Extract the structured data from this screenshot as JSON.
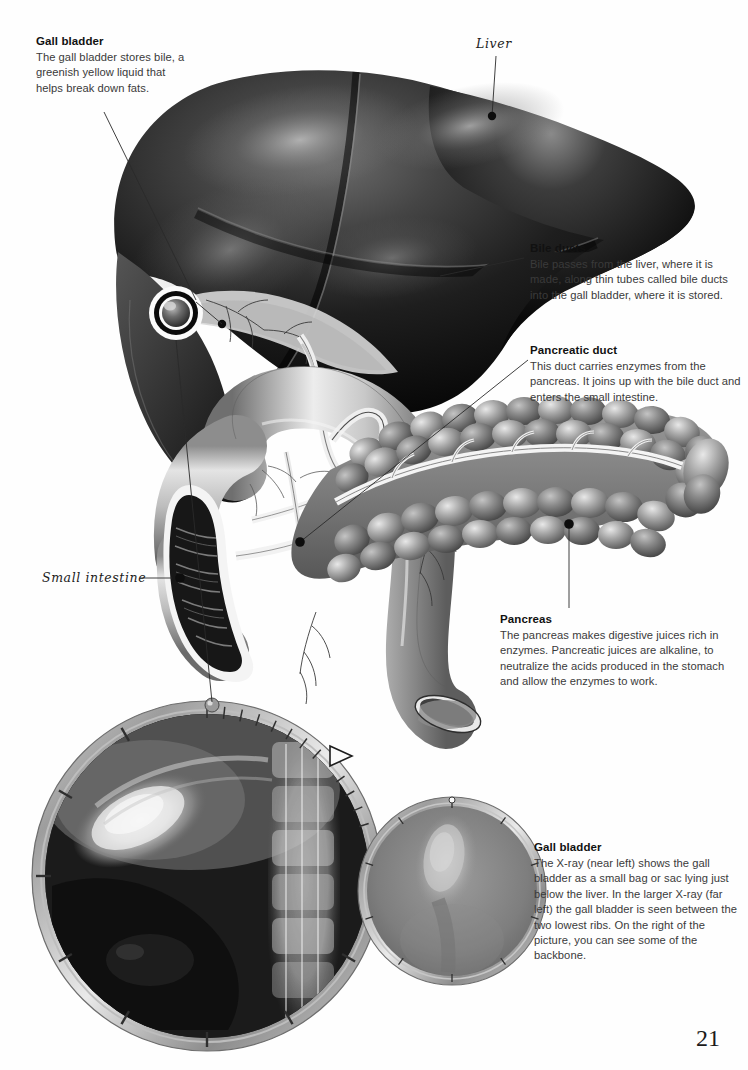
{
  "page": {
    "number": "21",
    "background_color": "#fefefe"
  },
  "captions": [
    {
      "id": "gall-bladder",
      "heading": "Gall bladder",
      "body": "The gall bladder stores bile, a greenish yellow liquid that helps break down fats."
    },
    {
      "id": "bile-ducts",
      "heading": "Bile ducts",
      "body": "Bile passes from the liver, where it is made, along thin tubes called bile ducts into the gall bladder, where it is stored."
    },
    {
      "id": "pancreatic-duct",
      "heading": "Pancreatic duct",
      "body": "This duct carries enzymes from the pancreas. It joins up with the bile duct and enters the small intestine."
    },
    {
      "id": "pancreas",
      "heading": "Pancreas",
      "body": "The pancreas makes digestive juices rich in enzymes. Pancreatic juices are alkaline, to neutralize the acids produced in the stomach and allow the enzymes to work."
    },
    {
      "id": "gall-bladder-xray",
      "heading": "Gall bladder",
      "body": "The X-ray (near left) shows the gall bladder as a small bag or sac lying just below the liver. In the larger X-ray (far left) the gall bladder is seen between the two lowest ribs. On the right of the picture, you can see some of the backbone."
    }
  ],
  "handwritten_labels": [
    {
      "id": "liver",
      "text": "Liver"
    },
    {
      "id": "small-intestine",
      "text": "Small intestine"
    }
  ],
  "illustration": {
    "organs": [
      "liver",
      "gall-bladder",
      "bile-duct",
      "pancreas",
      "pancreatic-duct",
      "duodenum",
      "small-intestine"
    ],
    "style": "airbrushed grayscale medical illustration",
    "liver_tone": "#151515",
    "pancreas_tone": "#8e8e8e",
    "duodenum_tone": "#b4b4b4"
  },
  "xrays": [
    {
      "id": "large-xray",
      "position": "far left",
      "shows": "gall bladder between the two lowest ribs and part of the backbone",
      "frame": "metal dial bezel with tick marks and pointer"
    },
    {
      "id": "small-xray",
      "position": "near left",
      "shows": "gall bladder as a small bag or sac",
      "frame": "metal dial bezel with tick marks"
    }
  ]
}
